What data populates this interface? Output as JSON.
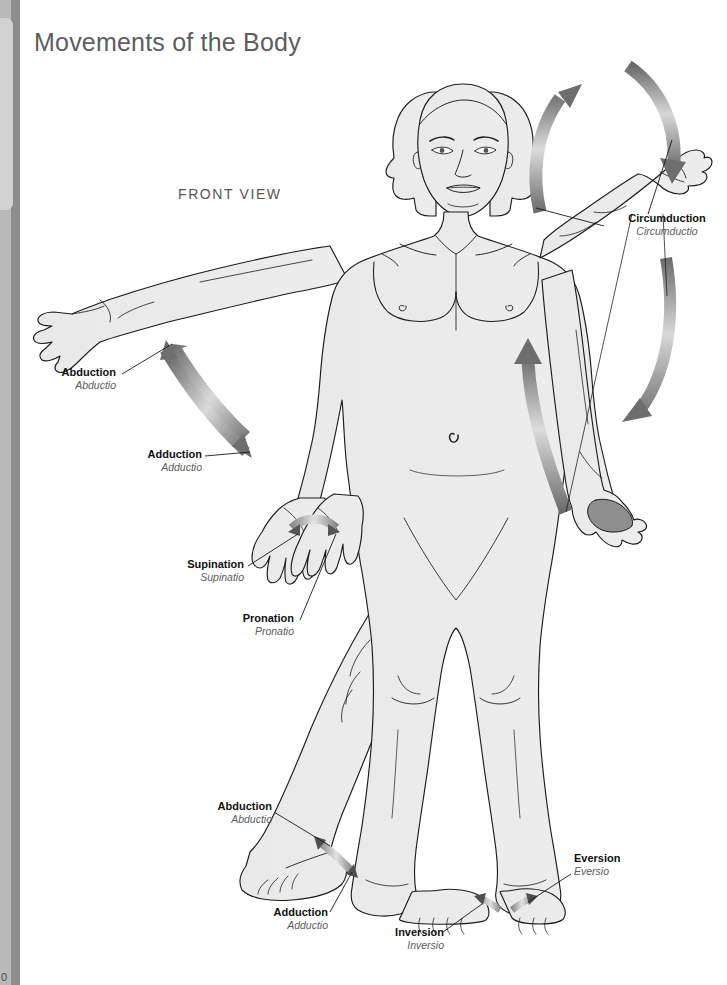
{
  "page": {
    "title": "Movements of the Body",
    "view_label": "FRONT VIEW",
    "folio": "0",
    "background_color": "#ffffff",
    "edge_dark_color": "#8d8d8d",
    "edge_light_color": "#b9b9b9",
    "edge_tab_color": "#d2d2d2",
    "body_fill_color": "#ebebeb",
    "outline_color": "#1a1a1a",
    "arrow_color": "#6e6e6e",
    "label_latin_color": "#5c5c5c"
  },
  "labels": [
    {
      "id": "abduction-arm",
      "en": "Abduction",
      "la": "Abductio"
    },
    {
      "id": "adduction-arm",
      "en": "Adduction",
      "la": "Adductio"
    },
    {
      "id": "supination",
      "en": "Supination",
      "la": "Supinatio"
    },
    {
      "id": "pronation",
      "en": "Pronation",
      "la": "Pronatio"
    },
    {
      "id": "circumduction",
      "en": "Circumduction",
      "la": "Circumductio"
    },
    {
      "id": "abduction-foot",
      "en": "Abduction",
      "la": "Abductio"
    },
    {
      "id": "adduction-foot",
      "en": "Adduction",
      "la": "Adductio"
    },
    {
      "id": "eversion",
      "en": "Eversion",
      "la": "Eversio"
    },
    {
      "id": "inversion",
      "en": "Inversion",
      "la": "Inversio"
    }
  ]
}
